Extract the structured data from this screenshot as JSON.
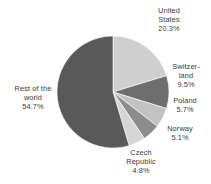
{
  "chart_data": {
    "type": "pie",
    "title": "",
    "subtitle": "",
    "xlabel": "",
    "ylabel": "",
    "legend_position": "none",
    "grid": false,
    "start_angle_deg": 0,
    "direction": "clockwise",
    "center": [
      113,
      92
    ],
    "radius": 56,
    "categories": [
      "United States",
      "Switzerland",
      "Poland",
      "Norway",
      "Czech Republic",
      "Rest of the world"
    ],
    "values": [
      20.3,
      9.5,
      5.7,
      5.1,
      4.8,
      54.7
    ],
    "value_labels": [
      "20.3%",
      "9.5%",
      "5.7%",
      "5.1%",
      "4.8%",
      "54.7%"
    ],
    "colors": [
      "#cfcfcf",
      "#6e6e6e",
      "#c2c2c2",
      "#8c8c8c",
      "#d6d6d6",
      "#595959"
    ],
    "slices": [
      {
        "name": "United States",
        "value": 20.3,
        "label": "20.3%",
        "color": "#cfcfcf"
      },
      {
        "name": "Switzerland",
        "value": 9.5,
        "label": "9.5%",
        "color": "#6e6e6e"
      },
      {
        "name": "Poland",
        "value": 5.7,
        "label": "5.7%",
        "color": "#c2c2c2"
      },
      {
        "name": "Norway",
        "value": 5.1,
        "label": "5.1%",
        "color": "#8c8c8c"
      },
      {
        "name": "Czech Republic",
        "value": 4.8,
        "label": "4.8%",
        "color": "#d6d6d6"
      },
      {
        "name": "Rest of the world",
        "value": 54.7,
        "label": "54.7%",
        "color": "#595959"
      }
    ]
  },
  "labels": {
    "united_states": "United\nStates\n20.3%",
    "switzerland": "Switzer-\nland\n9.5%",
    "poland": "Poland\n5.7%",
    "norway": "Norway\n5.1%",
    "czech_republic": "Czech\nRepublic\n4.8%",
    "rest_of_world": "Rest of the\nworld\n54.7%"
  },
  "style": {
    "background": "#ffffff",
    "text_color": "#3a3a3a"
  }
}
